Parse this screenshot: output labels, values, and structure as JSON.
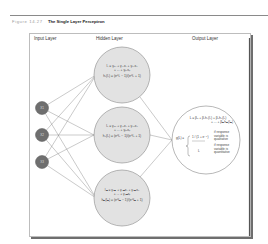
{
  "figure": {
    "number_label": "Figure 14.27",
    "title": "The Single Layer Perceptron"
  },
  "layers": {
    "input": "Input Layer",
    "hidden": "Hidden Layer",
    "output": "Output Layer"
  },
  "input_nodes": [
    {
      "label": "X1"
    },
    {
      "label": "X2"
    },
    {
      "label": "X3"
    }
  ],
  "hidden_nodes": [
    {
      "eq1": "l₁ = γ₀₁ + γ₁₁x₁ + γ₂₁x₂",
      "eq2": "+ ... + γₚ₁xₚ",
      "act": "h₁(l₁) = (e^l₁ − 1)/(e^l₁ + 1)"
    },
    {
      "eq1": "l₂ = γ₀₂ + γ₁₂x₁ + γ₂₂x₂",
      "eq2": "+ ... + γₚ₂xₚ",
      "act": "h₂(l₂) = (e^l₂ − 1)/(e^l₂ + 1)"
    },
    {
      "eq1": "lₘ = γ₀ₘ + γ₁ₘx₁ + γ₂ₘx₂",
      "eq2": "+ ... + γₚₘxₚ",
      "act": "hₘ(lₘ) = (e^lₘ − 1)/(e^lₘ + 1)"
    }
  ],
  "output_node": {
    "eq1": "L = β₀ + β₁h₁(l₁) + β₂h₂(l₂)",
    "eq2": "+ ... + βₘhₘ(lₘ)",
    "g_label": "g(L) =",
    "case1_expr": "1 / (1 + e⁻ᴸ)",
    "case1_text": [
      "if response",
      "variable is",
      "qualitative"
    ],
    "case2_expr": "L",
    "case2_text": [
      "if response",
      "variable is",
      "quantitative"
    ]
  },
  "colors": {
    "input_node": "#6f6f6f",
    "hidden_fill": "#e2e2e2",
    "output_fill": "#ffffff",
    "edge": "#7a7a7a"
  }
}
